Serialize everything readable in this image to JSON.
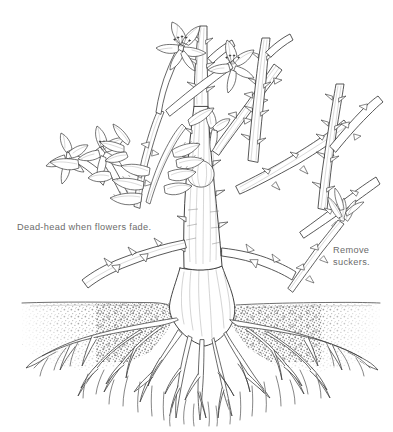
{
  "illustration": {
    "title": "Rose bush pruning diagram",
    "subject": "rose-bush",
    "style": "pen-and-ink line drawing",
    "width": 393,
    "height": 432,
    "background_color": "#ffffff",
    "ink_color": "#3a3a3a",
    "caption_color": "#6b6b6b",
    "soil_color": "#9a9a9a"
  },
  "captions": {
    "deadhead": "Dead-head when flowers fade.",
    "suckers": "Remove\nsuckers."
  },
  "parts": {
    "flowers_label": "rose-blooms",
    "leaves_label": "compound-leaves",
    "canes_label": "thorny-canes",
    "sucker_label": "sucker-shoot",
    "soil_label": "soil-cross-section",
    "ground_line_label": "ground-line",
    "crown_label": "root-crown",
    "roots_label": "root-system"
  }
}
